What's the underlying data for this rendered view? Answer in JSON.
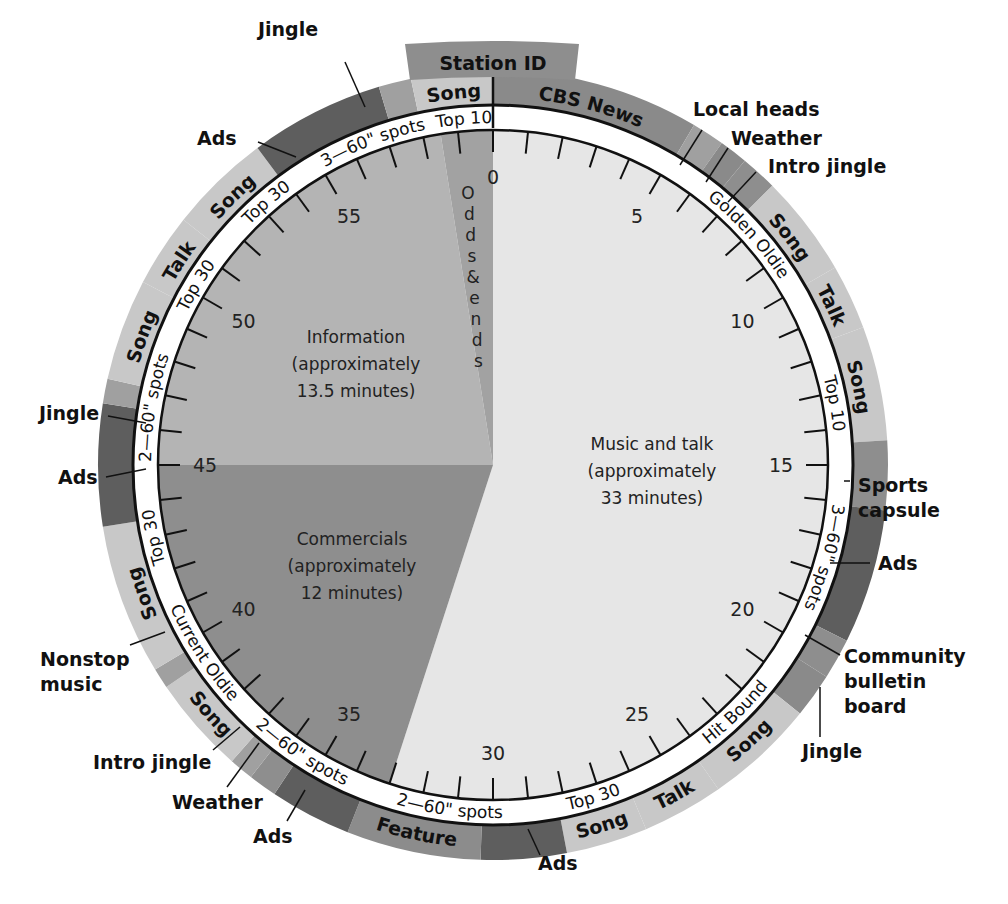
{
  "title_tab": "Station ID",
  "colors": {
    "music_talk": "#e6e6e6",
    "information": "#b4b4b4",
    "commercials": "#8e8e8e",
    "odds_ends": "#a2a2a2",
    "song_light": "#c8c8c8",
    "news_mid": "#8a8a8a",
    "ads_dark": "#5e5e5e",
    "jingle_mid": "#a0a0a0",
    "feature": "#8c8c8c",
    "white_ring": "#ffffff"
  },
  "center": {
    "music": [
      "Music and talk",
      "(approximately",
      "33 minutes)"
    ],
    "information": [
      "Information",
      "(approximately",
      "13.5 minutes)"
    ],
    "commercials": [
      "Commercials",
      "(approximately",
      "12 minutes)"
    ],
    "odds": [
      "O",
      "d",
      "d",
      "s",
      "&",
      "e",
      "n",
      "d",
      "s"
    ]
  },
  "tick_numbers": [
    "0",
    "5",
    "10",
    "15",
    "20",
    "25",
    "30",
    "35",
    "40",
    "45",
    "50",
    "55"
  ],
  "ring_labels": [
    {
      "text": "Golden Oldie",
      "at": 8.0
    },
    {
      "text": "Top 10",
      "at": 13.3
    },
    {
      "text": "3—60\" spots",
      "at": 17.6
    },
    {
      "text": "Hit Bound",
      "at": 22.6
    },
    {
      "text": "Top 30",
      "at": 27.2
    },
    {
      "text": "2—60\" spots",
      "at": 31.2
    },
    {
      "text": "2—60\" spots",
      "at": 35.6
    },
    {
      "text": "Current Oldie",
      "at": 39.5
    },
    {
      "text": "Top 30",
      "at": 43.0
    },
    {
      "text": "2—60\" spots",
      "at": 46.6
    },
    {
      "text": "Top 30",
      "at": 50.2
    },
    {
      "text": "Top 30",
      "at": 53.2
    },
    {
      "text": "3—60\" spots",
      "at": 56.6
    },
    {
      "text": "Top 10",
      "at": 59.2
    }
  ],
  "segments": [
    {
      "label": "CBS News",
      "start": 0.0,
      "end": 5.1,
      "tone": "news_mid"
    },
    {
      "label": "",
      "start": 5.1,
      "end": 5.9,
      "tone": "jingle_mid"
    },
    {
      "label": "",
      "start": 5.9,
      "end": 6.6,
      "tone": "news_mid"
    },
    {
      "label": "",
      "start": 6.6,
      "end": 7.5,
      "tone": "commercials"
    },
    {
      "label": "Song",
      "start": 7.5,
      "end": 10.0,
      "tone": "song_light"
    },
    {
      "label": "Talk",
      "start": 10.0,
      "end": 11.6,
      "tone": "song_light"
    },
    {
      "label": "Song",
      "start": 11.6,
      "end": 14.4,
      "tone": "song_light"
    },
    {
      "label": "",
      "start": 14.4,
      "end": 16.1,
      "tone": "commercials"
    },
    {
      "label": "",
      "start": 16.1,
      "end": 19.4,
      "tone": "ads_dark"
    },
    {
      "label": "",
      "start": 19.4,
      "end": 20.4,
      "tone": "commercials"
    },
    {
      "label": "",
      "start": 20.4,
      "end": 21.5,
      "tone": "news_mid"
    },
    {
      "label": "Song",
      "start": 21.5,
      "end": 24.2,
      "tone": "song_light"
    },
    {
      "label": "Talk",
      "start": 24.2,
      "end": 26.2,
      "tone": "song_light"
    },
    {
      "label": "Song",
      "start": 26.2,
      "end": 28.2,
      "tone": "song_light"
    },
    {
      "label": "",
      "start": 28.2,
      "end": 30.3,
      "tone": "ads_dark"
    },
    {
      "label": "Feature",
      "start": 30.3,
      "end": 33.6,
      "tone": "feature"
    },
    {
      "label": "",
      "start": 33.6,
      "end": 35.6,
      "tone": "ads_dark"
    },
    {
      "label": "",
      "start": 35.6,
      "end": 36.3,
      "tone": "commercials"
    },
    {
      "label": "",
      "start": 36.3,
      "end": 36.9,
      "tone": "jingle_mid"
    },
    {
      "label": "Song",
      "start": 36.9,
      "end": 39.3,
      "tone": "song_light"
    },
    {
      "label": "",
      "start": 39.3,
      "end": 39.8,
      "tone": "jingle_mid"
    },
    {
      "label": "Song",
      "start": 39.8,
      "end": 43.5,
      "tone": "song_light"
    },
    {
      "label": "",
      "start": 43.5,
      "end": 46.5,
      "tone": "ads_dark"
    },
    {
      "label": "",
      "start": 46.5,
      "end": 47.1,
      "tone": "jingle_mid"
    },
    {
      "label": "Song",
      "start": 47.1,
      "end": 49.6,
      "tone": "song_light"
    },
    {
      "label": "Talk",
      "start": 49.6,
      "end": 51.4,
      "tone": "song_light"
    },
    {
      "label": "Song",
      "start": 51.4,
      "end": 53.9,
      "tone": "song_light"
    },
    {
      "label": "",
      "start": 53.9,
      "end": 57.2,
      "tone": "ads_dark"
    },
    {
      "label": "",
      "start": 57.2,
      "end": 58.0,
      "tone": "jingle_mid"
    },
    {
      "label": "Song",
      "start": 58.0,
      "end": 60.0,
      "tone": "song_light"
    }
  ],
  "callouts": [
    {
      "lines": [
        "Jingle"
      ],
      "x": 258,
      "y": 36,
      "anchor": "start",
      "lx1": 345,
      "ly1": 62,
      "lx2": 365,
      "ly2": 107
    },
    {
      "lines": [
        "Ads"
      ],
      "x": 197,
      "y": 145,
      "anchor": "start",
      "lx1": 258,
      "ly1": 142,
      "lx2": 296,
      "ly2": 157
    },
    {
      "lines": [
        "Local heads"
      ],
      "x": 693,
      "y": 116,
      "anchor": "start",
      "lx1": 702,
      "ly1": 130,
      "lx2": 680,
      "ly2": 165
    },
    {
      "lines": [
        "Weather"
      ],
      "x": 731,
      "y": 145,
      "anchor": "start",
      "lx1": 728,
      "ly1": 148,
      "lx2": 706,
      "ly2": 182
    },
    {
      "lines": [
        "Intro jingle"
      ],
      "x": 768,
      "y": 173,
      "anchor": "start",
      "lx1": 756,
      "ly1": 172,
      "lx2": 728,
      "ly2": 202
    },
    {
      "lines": [
        "Sports",
        "capsule"
      ],
      "x": 858,
      "y": 492,
      "anchor": "start",
      "lx1": 850,
      "ly1": 481,
      "lx2": 844,
      "ly2": 481
    },
    {
      "lines": [
        "Ads"
      ],
      "x": 878,
      "y": 570,
      "anchor": "start",
      "lx1": 870,
      "ly1": 563,
      "lx2": 830,
      "ly2": 563
    },
    {
      "lines": [
        "Community",
        "bulletin",
        "board"
      ],
      "x": 844,
      "y": 663,
      "anchor": "start",
      "lx1": 840,
      "ly1": 655,
      "lx2": 805,
      "ly2": 635
    },
    {
      "lines": [
        "Jingle"
      ],
      "x": 802,
      "y": 758,
      "anchor": "start",
      "lx1": 820,
      "ly1": 737,
      "lx2": 820,
      "ly2": 687
    },
    {
      "lines": [
        "Ads"
      ],
      "x": 538,
      "y": 870,
      "anchor": "start",
      "lx1": 540,
      "ly1": 855,
      "lx2": 528,
      "ly2": 829
    },
    {
      "lines": [
        "Feature"
      ],
      "x": 0,
      "y": 0,
      "anchor": "start",
      "lx1": 0,
      "ly1": 0,
      "lx2": 0,
      "ly2": 0
    },
    {
      "lines": [
        "Ads"
      ],
      "x": 253,
      "y": 843,
      "anchor": "start",
      "lx1": 287,
      "ly1": 821,
      "lx2": 305,
      "ly2": 790
    },
    {
      "lines": [
        "Weather"
      ],
      "x": 172,
      "y": 809,
      "anchor": "start",
      "lx1": 227,
      "ly1": 787,
      "lx2": 259,
      "ly2": 743
    },
    {
      "lines": [
        "Intro jingle"
      ],
      "x": 93,
      "y": 769,
      "anchor": "start",
      "lx1": 213,
      "ly1": 750,
      "lx2": 240,
      "ly2": 727
    },
    {
      "lines": [
        "Nonstop",
        "music"
      ],
      "x": 40,
      "y": 666,
      "anchor": "start",
      "lx1": 130,
      "ly1": 645,
      "lx2": 165,
      "ly2": 632
    },
    {
      "lines": [
        "Ads"
      ],
      "x": 58,
      "y": 484,
      "anchor": "start",
      "lx1": 106,
      "ly1": 477,
      "lx2": 146,
      "ly2": 469
    },
    {
      "lines": [
        "Jingle"
      ],
      "x": 39,
      "y": 420,
      "anchor": "start",
      "lx1": 108,
      "ly1": 416,
      "lx2": 146,
      "ly2": 423
    }
  ]
}
